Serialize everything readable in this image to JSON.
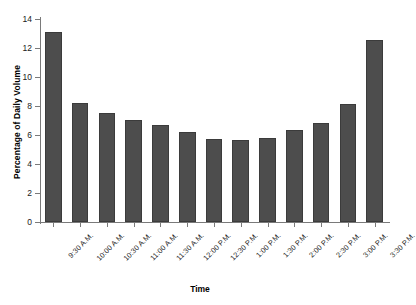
{
  "chart_data": {
    "type": "bar",
    "title": "",
    "xlabel": "Time",
    "ylabel": "Percentage of Daily Volume",
    "categories": [
      "9:30 A.M.",
      "10:00 A.M.",
      "10:30 A.M.",
      "11:00 A.M.",
      "11:30 A.M.",
      "12:00 P.M.",
      "12:30 P.M.",
      "1:00 P.M.",
      "1:30 P.M.",
      "2:00 P.M.",
      "2:30 P.M.",
      "3:00 P.M.",
      "3:30 P.M."
    ],
    "values": [
      13.1,
      8.2,
      7.55,
      7.05,
      6.7,
      6.2,
      5.7,
      5.65,
      5.8,
      6.35,
      6.85,
      8.15,
      12.55
    ],
    "ylim": [
      0,
      14
    ],
    "yticks": [
      0,
      2,
      4,
      6,
      8,
      10,
      12,
      14
    ],
    "ytick_labels": [
      "0",
      "2",
      "4",
      "6",
      "8",
      "10",
      "12",
      "14"
    ],
    "grid": false,
    "legend": null,
    "bar_color": "#4d4d4d",
    "bar_edge_color": "#3b3b3b",
    "axis_color": "#7a7a7a",
    "background": "#ffffff"
  }
}
